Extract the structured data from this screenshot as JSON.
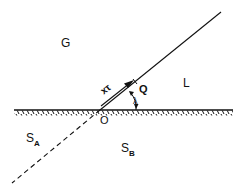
{
  "diagram": {
    "type": "contact-line geometry",
    "labels": {
      "gas": "G",
      "liquid": "L",
      "solid_a": "S",
      "solid_a_sub": "A",
      "solid_b": "S",
      "solid_b_sub": "B",
      "origin": "O",
      "point_q": "Q",
      "distance": "xτ",
      "angle": "λ"
    },
    "colors": {
      "ink": "#111111",
      "background": "#ffffff"
    },
    "elements": [
      "ground line with hatching (solid surface)",
      "solid interface line from O to upper right",
      "dashed extension line from O to lower left",
      "arrow parallel to interface labeled xτ",
      "angle λ between interface and ground"
    ]
  }
}
